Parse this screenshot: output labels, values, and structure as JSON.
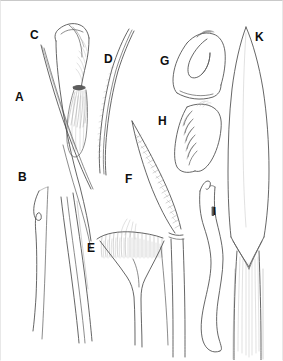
{
  "plate": {
    "title": "Morphological plate of appendage structures A–K",
    "background_color": "#ffffff",
    "ink_color": "#3a3a3a",
    "label_color": "#0f0f0f",
    "border_color": "#c9c9c9",
    "width_px": 283,
    "height_px": 361,
    "style": "pen-and-ink line drawing, no shading fills"
  },
  "labels": [
    {
      "id": "A",
      "text": "A",
      "x": 14,
      "y": 90,
      "description": "slender tapering seta / spine, upper left"
    },
    {
      "id": "B",
      "text": "B",
      "x": 17,
      "y": 170,
      "description": "elongate curved process, lower left"
    },
    {
      "id": "C",
      "text": "C",
      "x": 29,
      "y": 28,
      "description": "setose appendage tip with dense brush of setae"
    },
    {
      "id": "D",
      "text": "D",
      "x": 103,
      "y": 52,
      "description": "long curved flagellate element with fine marginal setae"
    },
    {
      "id": "E",
      "text": "E",
      "x": 86,
      "y": 241,
      "description": "fan-shaped plate bearing a comb row of fine setae"
    },
    {
      "id": "F",
      "text": "F",
      "x": 124,
      "y": 172,
      "description": "falciform claw with pectinate (comb-toothed) inner margin"
    },
    {
      "id": "G",
      "text": "G",
      "x": 159,
      "y": 54,
      "description": "hooked terminal segment, looped outline"
    },
    {
      "id": "H",
      "text": "H",
      "x": 157,
      "y": 114,
      "description": "broad lobe bearing a row of stout spiniform teeth"
    },
    {
      "id": "I",
      "text": "I",
      "x": 212,
      "y": 205,
      "description": "sinuous narrow elongate appendage"
    },
    {
      "id": "K",
      "text": "K",
      "x": 254,
      "y": 30,
      "description": "large lanceolate blade-like element, longitudinally striate base"
    }
  ],
  "figure_parts": [
    {
      "id": "A",
      "name": "seta-A",
      "kind": "tapering-spine"
    },
    {
      "id": "B",
      "name": "process-B",
      "kind": "curved-process"
    },
    {
      "id": "C",
      "name": "setose-tip-C",
      "kind": "brush-tipped-appendage"
    },
    {
      "id": "D",
      "name": "flagellum-D",
      "kind": "curved-flagellum"
    },
    {
      "id": "E",
      "name": "comb-plate-E",
      "kind": "fan-plate-with-setal-comb"
    },
    {
      "id": "F",
      "name": "pectinate-claw-F",
      "kind": "falciform-pectinate-claw"
    },
    {
      "id": "G",
      "name": "hooked-segment-G",
      "kind": "hooked-terminal-segment"
    },
    {
      "id": "H",
      "name": "toothed-lobe-H",
      "kind": "spiniform-toothed-lobe"
    },
    {
      "id": "I",
      "name": "sinuous-appendage-I",
      "kind": "sinuous-elongate-appendage"
    },
    {
      "id": "K",
      "name": "blade-K",
      "kind": "lanceolate-blade"
    }
  ]
}
